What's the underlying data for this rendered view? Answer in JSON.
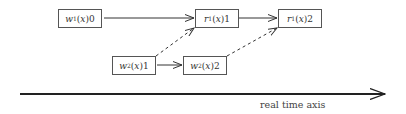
{
  "diagram": {
    "nodes": [
      {
        "id": "w1x0",
        "op": "w",
        "sub": "1",
        "var": "x",
        "val": "0"
      },
      {
        "id": "r1x1",
        "op": "r",
        "sub": "1",
        "var": "x",
        "val": "1"
      },
      {
        "id": "r1x2",
        "op": "r",
        "sub": "1",
        "var": "x",
        "val": "2"
      },
      {
        "id": "w2x1",
        "op": "w",
        "sub": "2",
        "var": "x",
        "val": "1"
      },
      {
        "id": "w2x2",
        "op": "w",
        "sub": "2",
        "var": "x",
        "val": "2"
      }
    ],
    "edges": [
      {
        "from": "w1x0",
        "to": "r1x1",
        "style": "solid"
      },
      {
        "from": "r1x1",
        "to": "r1x2",
        "style": "solid"
      },
      {
        "from": "w2x1",
        "to": "w2x2",
        "style": "solid"
      },
      {
        "from": "w2x1",
        "to": "r1x1",
        "style": "dashed"
      },
      {
        "from": "w2x2",
        "to": "r1x2",
        "style": "dashed"
      }
    ],
    "axis_label": "real time axis"
  }
}
